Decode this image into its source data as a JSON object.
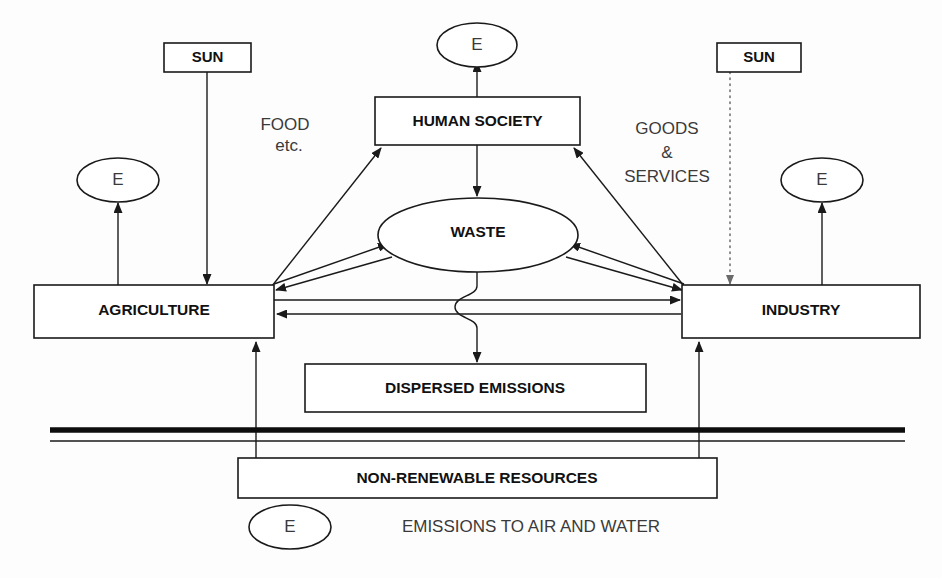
{
  "diagram": {
    "nodes": {
      "sun_left": {
        "label": "SUN",
        "type": "box"
      },
      "sun_right": {
        "label": "SUN",
        "type": "box"
      },
      "human_society": {
        "label": "HUMAN SOCIETY",
        "type": "box"
      },
      "waste": {
        "label": "WASTE",
        "type": "ellipse"
      },
      "agriculture": {
        "label": "AGRICULTURE",
        "type": "box"
      },
      "industry": {
        "label": "INDUSTRY",
        "type": "box"
      },
      "dispersed_emissions": {
        "label": "DISPERSED EMISSIONS",
        "type": "box"
      },
      "non_renewable_resources": {
        "label": "NON-RENEWABLE RESOURCES",
        "type": "box"
      },
      "e_top": {
        "label": "E",
        "type": "ellipse"
      },
      "e_left": {
        "label": "E",
        "type": "ellipse"
      },
      "e_right": {
        "label": "E",
        "type": "ellipse"
      },
      "e_legend": {
        "label": "E",
        "type": "ellipse"
      }
    },
    "flow_labels": {
      "food": "FOOD",
      "food_etc": "etc.",
      "goods": "GOODS",
      "ampersand": "&",
      "services": "SERVICES"
    },
    "legend": {
      "emissions_caption": "EMISSIONS TO AIR AND WATER"
    },
    "colors": {
      "stroke": "#1a1a1a",
      "dotted_stroke": "#6a6a6a",
      "fill": "#ffffff",
      "background": "#fdfdfd",
      "text": "#111111",
      "text_plain": "#3a3a3a"
    }
  }
}
